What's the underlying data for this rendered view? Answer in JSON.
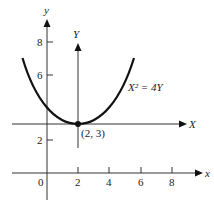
{
  "diagram": {
    "type": "coordinate-translation",
    "equation_label": "X² = 4Y",
    "vertex_label": "(2, 3)",
    "original_axes": {
      "x_label": "x",
      "y_label": "y",
      "origin_label": "0",
      "x_ticks": [
        "2",
        "4",
        "6",
        "8"
      ],
      "y_ticks": [
        "2",
        "6",
        "8"
      ]
    },
    "translated_axes": {
      "x_label": "X",
      "y_label": "Y",
      "origin": [
        2,
        3
      ]
    },
    "curve": {
      "kind": "parabola",
      "equation": "(x-2)^2 = 4(y-3)",
      "vertex": [
        2,
        3
      ]
    },
    "colors": {
      "stroke": "#111111",
      "text": "#222222"
    }
  }
}
